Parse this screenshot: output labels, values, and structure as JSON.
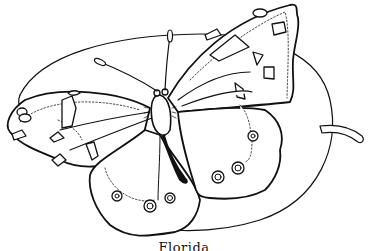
{
  "illustration": {
    "subject": "butterfly-on-leaf",
    "style": "black-and-white line drawing (coloring page)",
    "caption": "Florida",
    "colors": {
      "ink": "#111111",
      "paper": "#ffffff"
    }
  }
}
